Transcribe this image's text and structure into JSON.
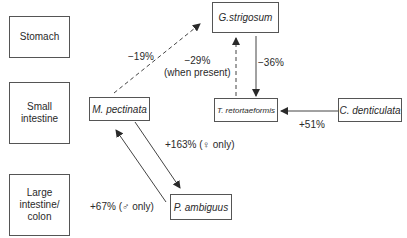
{
  "regions": [
    {
      "label": "Stomach"
    },
    {
      "label": "Small intestine"
    },
    {
      "label": "Large intestine/ colon"
    }
  ],
  "species": {
    "g_strigosum": "G.strigosum",
    "m_pectinata": "M. pectinata",
    "t_retortaeformis": "T. retortaeformis",
    "c_denticulata": "C. denticulata",
    "p_ambiguus": "P. ambiguus"
  },
  "edges": {
    "m_to_g": {
      "label": "−19%",
      "style": "dashed"
    },
    "t_to_g": {
      "label_line1": "−29%",
      "label_line2": "(when present)",
      "style": "dashed"
    },
    "g_to_t": {
      "label": "−36%",
      "style": "solid"
    },
    "c_to_t": {
      "label": "+51%",
      "style": "solid"
    },
    "m_to_p": {
      "label": "+163% (♀ only)",
      "style": "solid"
    },
    "p_to_m": {
      "label": "+67% (♂ only)",
      "style": "solid"
    }
  }
}
